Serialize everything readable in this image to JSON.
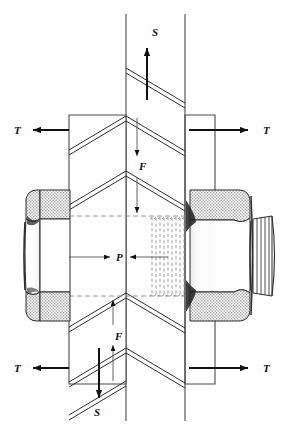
{
  "figure": {
    "type": "engineering-assembly-diagram",
    "background_color": "#ffffff",
    "line_color": "#1a1a1a",
    "hatch_color": "#9a9a9a",
    "dash_color": "#777777"
  },
  "labels": {
    "shear_top": "S",
    "shear_bottom": "S",
    "tension_top_left": "T",
    "tension_top_right": "T",
    "tension_bottom_left": "T",
    "tension_bottom_right": "T",
    "force_upper": "F",
    "force_lower": "F",
    "preload": "P"
  },
  "annotations": [
    {
      "name": "shear-top",
      "symbol": "S",
      "direction": "up",
      "x": 155,
      "y": 33
    },
    {
      "name": "shear-bottom",
      "symbol": "S",
      "direction": "down",
      "x": 97,
      "y": 413
    },
    {
      "name": "tension-top-left",
      "symbol": "T",
      "direction": "left",
      "x": 20,
      "y": 130
    },
    {
      "name": "tension-top-right",
      "symbol": "T",
      "direction": "right",
      "x": 268,
      "y": 130
    },
    {
      "name": "tension-bottom-left",
      "symbol": "T",
      "direction": "left",
      "x": 20,
      "y": 366
    },
    {
      "name": "tension-bottom-right",
      "symbol": "T",
      "direction": "right",
      "x": 268,
      "y": 366
    },
    {
      "name": "force-upper",
      "symbol": "F",
      "direction": "down",
      "x": 143,
      "y": 166
    },
    {
      "name": "force-lower",
      "symbol": "F",
      "direction": "up",
      "x": 118,
      "y": 336
    },
    {
      "name": "preload",
      "symbol": "P",
      "direction": "inward-pair",
      "x": 120,
      "y": 257
    }
  ],
  "components": {
    "bolt_head": "hex-bolt-head-left",
    "nut": "hex-nut-right",
    "threaded_shank": "threaded-shank-center",
    "protruding_thread": "protruding-thread-right",
    "left_plate": "left-plate",
    "right_plate": "right-plate",
    "center_member": "center-member"
  }
}
